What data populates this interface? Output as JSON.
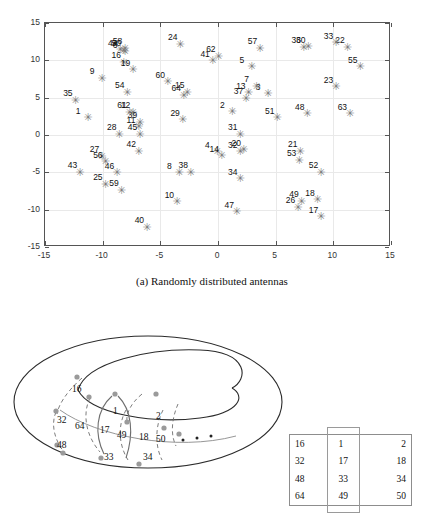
{
  "figure_a": {
    "caption": "(a) Randomly distributed antennas",
    "chart_data": {
      "type": "scatter",
      "title": "",
      "xlabel": "",
      "ylabel": "",
      "xlim": [
        -15,
        15
      ],
      "ylim": [
        -15,
        15
      ],
      "grid": true,
      "legend": null,
      "marker": "asterisk",
      "marker_color": "#7d7d7d",
      "xticks": [
        -15,
        -10,
        -5,
        0,
        5,
        10,
        15
      ],
      "yticks": [
        -15,
        -10,
        -5,
        0,
        5,
        10,
        15
      ],
      "xticklabels": [
        "-15",
        "-10",
        "-5",
        "0",
        "5",
        "10",
        "15"
      ],
      "yticklabels": [
        "-15",
        "-10",
        "-5",
        "0",
        "5",
        "10",
        "15"
      ],
      "points": [
        {
          "label": "1",
          "x": -11.2,
          "y": 2.2
        },
        {
          "label": "2",
          "x": 1.3,
          "y": 3.0
        },
        {
          "label": "3",
          "x": 4.4,
          "y": 5.4
        },
        {
          "label": "4",
          "x": 0.0,
          "y": -2.4
        },
        {
          "label": "5",
          "x": 3.0,
          "y": 9.0
        },
        {
          "label": "6",
          "x": -8.0,
          "y": 11.0
        },
        {
          "label": "7",
          "x": 3.4,
          "y": 6.4
        },
        {
          "label": "8",
          "x": -3.3,
          "y": -5.2
        },
        {
          "label": "9",
          "x": -10.0,
          "y": 7.5
        },
        {
          "label": "10",
          "x": -3.5,
          "y": -9.1
        },
        {
          "label": "11",
          "x": -6.8,
          "y": 1.0
        },
        {
          "label": "12",
          "x": -7.3,
          "y": 2.9
        },
        {
          "label": "13",
          "x": 2.7,
          "y": 5.5
        },
        {
          "label": "14",
          "x": 0.4,
          "y": -2.9
        },
        {
          "label": "15",
          "x": -2.6,
          "y": 5.6
        },
        {
          "label": "16",
          "x": -8.1,
          "y": 9.6
        },
        {
          "label": "17",
          "x": 9.0,
          "y": -11.1
        },
        {
          "label": "18",
          "x": 8.7,
          "y": -8.8
        },
        {
          "label": "19",
          "x": -7.3,
          "y": 8.6
        },
        {
          "label": "20",
          "x": 2.3,
          "y": -2.1
        },
        {
          "label": "21",
          "x": 7.2,
          "y": -2.3
        },
        {
          "label": "22",
          "x": 11.3,
          "y": 11.6
        },
        {
          "label": "23",
          "x": 10.3,
          "y": 6.3
        },
        {
          "label": "24",
          "x": -3.2,
          "y": 12.0
        },
        {
          "label": "25",
          "x": -9.7,
          "y": -6.7
        },
        {
          "label": "26",
          "x": 7.0,
          "y": -9.8
        },
        {
          "label": "27",
          "x": -10.0,
          "y": -3.0
        },
        {
          "label": "28",
          "x": -8.5,
          "y": 0.0
        },
        {
          "label": "29",
          "x": -3.0,
          "y": 1.9
        },
        {
          "label": "30",
          "x": 7.9,
          "y": 11.7
        },
        {
          "label": "31",
          "x": 2.0,
          "y": 0.0
        },
        {
          "label": "32",
          "x": 2.0,
          "y": -2.4
        },
        {
          "label": "33",
          "x": 10.3,
          "y": 12.2
        },
        {
          "label": "34",
          "x": 2.0,
          "y": -6.0
        },
        {
          "label": "35",
          "x": -12.3,
          "y": 4.5
        },
        {
          "label": "36",
          "x": 7.5,
          "y": 11.6
        },
        {
          "label": "37",
          "x": 2.5,
          "y": 4.8
        },
        {
          "label": "38",
          "x": -2.3,
          "y": -5.1
        },
        {
          "label": "39",
          "x": -6.7,
          "y": 1.6
        },
        {
          "label": "40",
          "x": -6.1,
          "y": -12.5
        },
        {
          "label": "41",
          "x": -0.4,
          "y": 9.8
        },
        {
          "label": "42",
          "x": -6.8,
          "y": -2.3
        },
        {
          "label": "43",
          "x": -11.9,
          "y": -5.1
        },
        {
          "label": "44",
          "x": -8.4,
          "y": 11.3
        },
        {
          "label": "45",
          "x": -6.7,
          "y": 0.0
        },
        {
          "label": "46",
          "x": -8.7,
          "y": -5.2
        },
        {
          "label": "47",
          "x": 1.7,
          "y": -10.4
        },
        {
          "label": "48",
          "x": 7.8,
          "y": 2.7
        },
        {
          "label": "49",
          "x": 7.3,
          "y": -9.0
        },
        {
          "label": "50",
          "x": -8.1,
          "y": 11.2
        },
        {
          "label": "51",
          "x": 5.2,
          "y": 2.2
        },
        {
          "label": "52",
          "x": 9.0,
          "y": -5.1
        },
        {
          "label": "53",
          "x": 7.1,
          "y": -3.5
        },
        {
          "label": "54",
          "x": -7.8,
          "y": 5.6
        },
        {
          "label": "55",
          "x": 12.4,
          "y": 9.0
        },
        {
          "label": "56",
          "x": -9.7,
          "y": -3.7
        },
        {
          "label": "57",
          "x": 3.7,
          "y": 11.5
        },
        {
          "label": "58",
          "x": -8.0,
          "y": 11.5
        },
        {
          "label": "59",
          "x": -8.3,
          "y": -7.5
        },
        {
          "label": "60",
          "x": -4.3,
          "y": 7.0
        },
        {
          "label": "61",
          "x": -7.6,
          "y": 2.9
        },
        {
          "label": "62",
          "x": 0.1,
          "y": 10.4
        },
        {
          "label": "63",
          "x": 11.5,
          "y": 2.7
        },
        {
          "label": "64",
          "x": -2.9,
          "y": 5.2
        }
      ]
    }
  },
  "figure_b": {
    "torus_labels": [
      {
        "text": "16",
        "x": 72,
        "y": 66
      },
      {
        "text": "32",
        "x": 57,
        "y": 97
      },
      {
        "text": "64",
        "x": 75,
        "y": 103
      },
      {
        "text": "48",
        "x": 57,
        "y": 122
      },
      {
        "text": "1",
        "x": 113,
        "y": 88
      },
      {
        "text": "17",
        "x": 100,
        "y": 107
      },
      {
        "text": "49",
        "x": 117,
        "y": 112
      },
      {
        "text": "33",
        "x": 104,
        "y": 134
      },
      {
        "text": "2",
        "x": 156,
        "y": 93
      },
      {
        "text": "18",
        "x": 139,
        "y": 114
      },
      {
        "text": "50",
        "x": 156,
        "y": 116
      },
      {
        "text": "34",
        "x": 143,
        "y": 134
      }
    ],
    "ellipsis_dots": [
      {
        "x": 183,
        "y": 440
      },
      {
        "x": 197,
        "y": 438
      },
      {
        "x": 211,
        "y": 436
      }
    ],
    "table": {
      "rows": [
        [
          "16",
          "1",
          "2"
        ],
        [
          "32",
          "17",
          "18"
        ],
        [
          "48",
          "33",
          "34"
        ],
        [
          "64",
          "49",
          "50"
        ]
      ]
    }
  }
}
